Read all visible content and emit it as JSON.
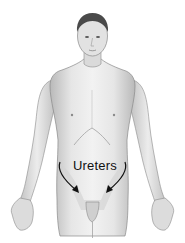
{
  "figure": {
    "label": "Ureters",
    "arrows": 2,
    "colors": {
      "background": "#ffffff",
      "skin_light": "#eeeeee",
      "skin_mid": "#d6d6d6",
      "skin_shadow": "#a9a9a9",
      "hair": "#4a4a4a",
      "outline": "#7a7a7a",
      "highlight_region": "#dedede",
      "arrow": "#111111",
      "label": "#111111"
    }
  }
}
